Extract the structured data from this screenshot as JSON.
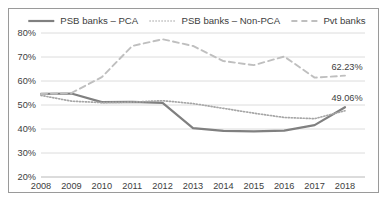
{
  "chart_data": {
    "type": "line",
    "title": "",
    "xlabel": "",
    "ylabel": "",
    "x": [
      "2008",
      "2009",
      "2010",
      "2011",
      "2012",
      "2013",
      "2014",
      "2015",
      "2016",
      "2017",
      "2018"
    ],
    "ylim": [
      20,
      80
    ],
    "yticks": [
      "20%",
      "30%",
      "40%",
      "50%",
      "60%",
      "70%",
      "80%"
    ],
    "ytick_values": [
      20,
      30,
      40,
      50,
      60,
      70,
      80
    ],
    "grid": true,
    "legend_position": "top",
    "series": [
      {
        "name": "PSB banks – PCA",
        "style": "solid",
        "color": "#808080",
        "values": [
          54.6,
          54.8,
          51.2,
          51.3,
          50.9,
          40.4,
          39.2,
          39.0,
          39.3,
          41.6,
          49.06
        ]
      },
      {
        "name": "PSB banks – Non-PCA",
        "style": "dotted",
        "color": "#a6a6a6",
        "values": [
          54.0,
          51.6,
          51.0,
          51.2,
          51.8,
          50.6,
          48.6,
          46.6,
          44.8,
          44.3,
          47.6
        ]
      },
      {
        "name": "Pvt banks",
        "style": "dashed",
        "color": "#bfbfbf",
        "values": [
          54.6,
          55.0,
          61.6,
          74.6,
          77.4,
          74.6,
          68.3,
          66.6,
          70.2,
          61.4,
          62.23
        ]
      }
    ],
    "annotations": [
      {
        "name": "pvt-banks-end-label",
        "text": "62.23%",
        "series": "Pvt banks",
        "x": "2018",
        "value": 62.23
      },
      {
        "name": "psb-pca-end-label",
        "text": "49.06%",
        "series": "PSB banks – PCA",
        "x": "2018",
        "value": 49.06
      }
    ]
  }
}
